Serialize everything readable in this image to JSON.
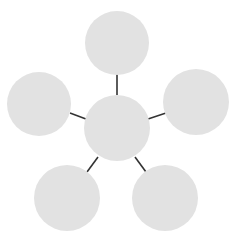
{
  "diagram": {
    "type": "hub-and-spoke",
    "node_fill": "#e2e2e2",
    "connector_color": "#333333",
    "center": {
      "id": "center",
      "cx": 117,
      "cy": 128,
      "r": 33
    },
    "satellites": [
      {
        "id": "top",
        "cx": 117,
        "cy": 43,
        "r": 32
      },
      {
        "id": "right",
        "cx": 196,
        "cy": 102,
        "r": 33
      },
      {
        "id": "bottom-right",
        "cx": 165,
        "cy": 198,
        "r": 33
      },
      {
        "id": "bottom-left",
        "cx": 67,
        "cy": 198,
        "r": 33
      },
      {
        "id": "left",
        "cx": 39,
        "cy": 104,
        "r": 32
      }
    ],
    "connectors": [
      {
        "to": "top",
        "x1": 117,
        "y1": 72,
        "x2": 117,
        "y2": 95
      },
      {
        "to": "right",
        "x1": 148,
        "y1": 119,
        "x2": 166,
        "y2": 113
      },
      {
        "to": "bottom-right",
        "x1": 135,
        "y1": 157,
        "x2": 146,
        "y2": 172
      },
      {
        "to": "bottom-left",
        "x1": 98,
        "y1": 157,
        "x2": 87,
        "y2": 172
      },
      {
        "to": "left",
        "x1": 70,
        "y1": 113,
        "x2": 86,
        "y2": 119
      }
    ]
  }
}
